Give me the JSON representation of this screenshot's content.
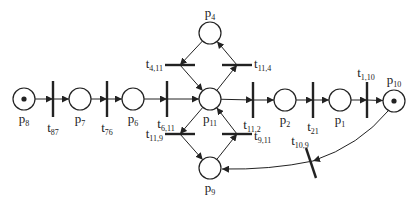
{
  "diagram": {
    "type": "petri-net",
    "colors": {
      "stroke": "#222222",
      "background": "#ffffff"
    },
    "places": [
      {
        "id": "p8",
        "base": "p",
        "sub": "8",
        "tokens": 1
      },
      {
        "id": "p7",
        "base": "p",
        "sub": "7",
        "tokens": 0
      },
      {
        "id": "p6",
        "base": "p",
        "sub": "6",
        "tokens": 0
      },
      {
        "id": "p4",
        "base": "p",
        "sub": "4",
        "tokens": 0
      },
      {
        "id": "p11",
        "base": "p",
        "sub": "11",
        "tokens": 0
      },
      {
        "id": "p9",
        "base": "p",
        "sub": "9",
        "tokens": 0
      },
      {
        "id": "p2",
        "base": "p",
        "sub": "2",
        "tokens": 0
      },
      {
        "id": "p1",
        "base": "p",
        "sub": "1",
        "tokens": 0
      },
      {
        "id": "p10",
        "base": "p",
        "sub": "10",
        "tokens": 1
      }
    ],
    "transitions": [
      {
        "id": "t87",
        "base": "t",
        "sub": "87"
      },
      {
        "id": "t76",
        "base": "t",
        "sub": "76"
      },
      {
        "id": "t611",
        "base": "t",
        "sub": "6,11"
      },
      {
        "id": "t411",
        "base": "t",
        "sub": "4,11"
      },
      {
        "id": "t114",
        "base": "t",
        "sub": "11,4"
      },
      {
        "id": "t119",
        "base": "t",
        "sub": "11,9"
      },
      {
        "id": "t911",
        "base": "t",
        "sub": "9,11"
      },
      {
        "id": "t112",
        "base": "t",
        "sub": "11,2"
      },
      {
        "id": "t21",
        "base": "t",
        "sub": "21"
      },
      {
        "id": "t110",
        "base": "t",
        "sub": "1,10"
      },
      {
        "id": "t109",
        "base": "t",
        "sub": "10,9"
      }
    ],
    "arcs": [
      [
        "p8",
        "t87"
      ],
      [
        "t87",
        "p7"
      ],
      [
        "p7",
        "t76"
      ],
      [
        "t76",
        "p6"
      ],
      [
        "p6",
        "t611"
      ],
      [
        "t611",
        "p11"
      ],
      [
        "p4",
        "t411"
      ],
      [
        "t411",
        "p11"
      ],
      [
        "p11",
        "t114"
      ],
      [
        "t114",
        "p4"
      ],
      [
        "p11",
        "t119"
      ],
      [
        "t119",
        "p9"
      ],
      [
        "p9",
        "t911"
      ],
      [
        "t911",
        "p11"
      ],
      [
        "p11",
        "t112"
      ],
      [
        "t112",
        "p2"
      ],
      [
        "p2",
        "t21"
      ],
      [
        "t21",
        "p1"
      ],
      [
        "p1",
        "t110"
      ],
      [
        "t110",
        "p10"
      ],
      [
        "p10",
        "t109"
      ],
      [
        "t109",
        "p9"
      ]
    ]
  }
}
